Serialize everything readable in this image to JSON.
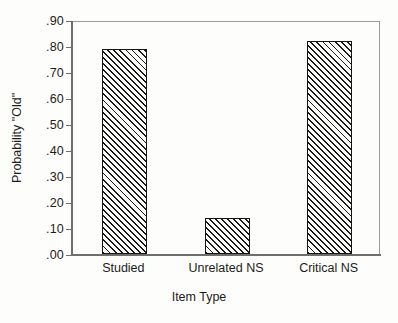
{
  "chart_data": {
    "type": "bar",
    "title": "",
    "xlabel": "Item Type",
    "ylabel": "Probability \"Old\"",
    "categories": [
      "Studied",
      "Unrelated NS",
      "Critical NS"
    ],
    "values": [
      0.79,
      0.14,
      0.82
    ],
    "ylim": [
      0.0,
      0.9
    ],
    "ytick_values": [
      0.0,
      0.1,
      0.2,
      0.3,
      0.4,
      0.5,
      0.6,
      0.7,
      0.8,
      0.9
    ],
    "ytick_labels": [
      ".00",
      ".10",
      ".20",
      ".30",
      ".40",
      ".50",
      ".60",
      ".70",
      ".80",
      ".90"
    ],
    "grid": false,
    "legend": null,
    "bar_fill": "diagonal-hatch",
    "bar_border_color": "#141414",
    "text_color": "#1c1c1c",
    "background_color": "#fdfdfb"
  }
}
